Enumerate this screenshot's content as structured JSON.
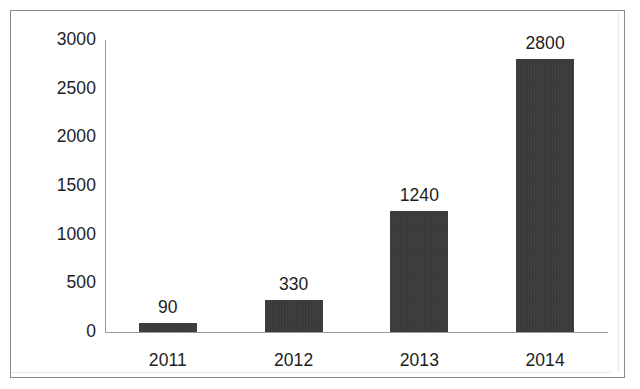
{
  "chart_data": {
    "type": "bar",
    "title": "",
    "subtitle": "",
    "xlabel": "",
    "ylabel": "",
    "categories": [
      "2011",
      "2012",
      "2013",
      "2014"
    ],
    "values": [
      90,
      330,
      1240,
      2800
    ],
    "data_labels": [
      "90",
      "330",
      "1240",
      "2800"
    ],
    "series": [
      {
        "name": "",
        "values": [
          90,
          330,
          1240,
          2800
        ]
      }
    ],
    "ylim": [
      0,
      3000
    ],
    "y_ticks": [
      0,
      500,
      1000,
      1500,
      2000,
      2500,
      3000
    ],
    "y_tick_labels": [
      "0",
      "500",
      "1000",
      "1500",
      "2000",
      "2500",
      "3000"
    ],
    "grid": false,
    "legend": false,
    "legend_position": "none",
    "bar_color": "#363636",
    "axis_color": "#9a9a9a",
    "text_color": "#1d1d1d",
    "background_color": "#ffffff",
    "frame_color": "#8a8a8a"
  }
}
